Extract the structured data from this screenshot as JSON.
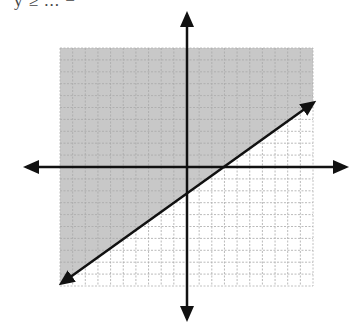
{
  "header": {
    "partial_text": "y ≥ ... −"
  },
  "graph": {
    "grid": {
      "x_min": -10,
      "x_max": 10,
      "y_min": -10,
      "y_max": 10,
      "step": 1
    },
    "pixel_box": {
      "left": 60,
      "right": 313,
      "top": 48,
      "bottom": 286
    },
    "origin_px": {
      "x": 187,
      "y": 167
    },
    "axes": {
      "x_arrow_left": 27,
      "x_arrow_right": 345,
      "y_arrow_top": 15,
      "y_arrow_bottom": 318
    },
    "boundary_line": {
      "style": "solid",
      "p1_px": {
        "x": 62,
        "y": 283
      },
      "p2_px": {
        "x": 313,
        "y": 103
      },
      "y_intercept": -2,
      "x_intercept": 3,
      "approx_slope": "2/3",
      "arrows": "both ends"
    },
    "shaded_region": "above/left of the line",
    "colors": {
      "shade": "#c8c8c8",
      "grid_line": "#a8a8a8",
      "axis": "#111111",
      "background": "#ffffff"
    }
  }
}
